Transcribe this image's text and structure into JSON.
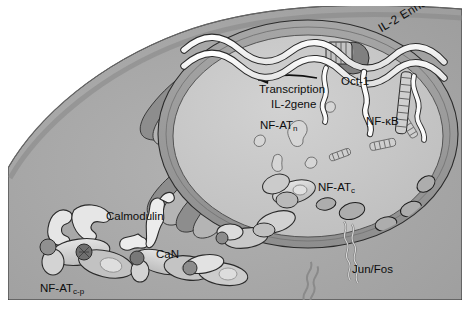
{
  "figure": {
    "style": "grayscale scientific cell-biology illustration",
    "background_color": "#ffffff",
    "colors": {
      "page_background": "#ffffff",
      "cytoplasm": "#a9a9a9",
      "cell_membrane_band": "#8f8f8f",
      "nucleoplasm": "#c9c9c9",
      "nuclear_envelope": "#9d9d9d",
      "golgi_dark": "#8a8a8a",
      "golgi_light": "#b5b5b5",
      "protein_light": "#dcdcdc",
      "protein_mid": "#b8b8b8",
      "protein_dark": "#777777",
      "dna_ribbon": "#fbfbfb",
      "outline": "#2b2b2b",
      "text": "#0d0d0d"
    }
  },
  "labels": {
    "transcription": "Transcription",
    "il2gene": "IL-2gene",
    "nfat_n": "NF-AT",
    "nfat_n_sub": "n",
    "oct1": "Oct-1",
    "nfkb": "NF-κB",
    "nfat_c": "NF-AT",
    "nfat_c_sub": "c",
    "junfos": "Jun/Fos",
    "calmodulin": "Calmodulin",
    "can": "CaN",
    "nfat_cp": "NF-AT",
    "nfat_cp_sub": "c-p",
    "il2_enhancer": "IL-2 Enhancer"
  },
  "structures": {
    "cell": "large rounded cell filling frame, membrane arcs from upper-left to lower-right",
    "nucleus": "large ellipse occupying right two-thirds, lighter interior",
    "nuclear_pores": "elliptical pore openings along lower-right nuclear envelope",
    "golgi_er": "stacked folded membrane cisternae at left/center of cytoplasm",
    "dna_ribbon": "white double-helix ribbon crossing the top of the nucleus",
    "transcription_arrow": "black arrow pointing left toward IL-2 gene",
    "oct1_shape": "dark filled circle bound to DNA",
    "nfkb_shape": "ladder/ribbon protein at DNA",
    "junfos_shape": "coiled-coil leucine zipper at lower nuclear envelope",
    "nfat_complexes": "multilobed protein blobs in cytoplasm and nucleus",
    "calmodulin_shape": "thin dumbbell-shaped protein",
    "can_shape": "calcineurin two-lobed protein complex",
    "phosphate_group": "dark knob on NF-AT c-p complex"
  }
}
